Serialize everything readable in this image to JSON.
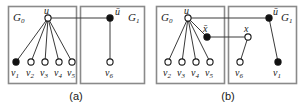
{
  "figure": {
    "width": 304,
    "height": 102,
    "background": "#ffffff",
    "stroke_color": "#3a3a3a",
    "box_color": "#8a8a8a",
    "node_fill_black": "#111111",
    "node_fill_white": "#ffffff"
  },
  "panels": [
    {
      "id": "a",
      "caption": "(a)",
      "boxes": [
        {
          "id": "G0",
          "label": "G₀",
          "label_text": "G",
          "label_sub": "0"
        },
        {
          "id": "G1",
          "label": "G₁",
          "label_text": "G",
          "label_sub": "1"
        }
      ],
      "nodes": [
        {
          "id": "u",
          "label": "u",
          "fill": "white",
          "cx": 48,
          "cy": 18
        },
        {
          "id": "v1",
          "label": "v₁",
          "fill": "black",
          "cx": 16,
          "cy": 62
        },
        {
          "id": "v2",
          "label": "v₂",
          "fill": "white",
          "cx": 31,
          "cy": 62
        },
        {
          "id": "v3",
          "label": "v₃",
          "fill": "white",
          "cx": 45,
          "cy": 62
        },
        {
          "id": "v4",
          "label": "v₄",
          "fill": "white",
          "cx": 59,
          "cy": 62
        },
        {
          "id": "v5",
          "label": "v₅",
          "fill": "white",
          "cx": 72,
          "cy": 62
        },
        {
          "id": "ubar",
          "label": "ū",
          "fill": "black",
          "cx": 110,
          "cy": 18
        },
        {
          "id": "v6",
          "label": "v₆",
          "fill": "white",
          "cx": 110,
          "cy": 62
        }
      ],
      "edges": [
        {
          "from": "u",
          "to": "v1"
        },
        {
          "from": "u",
          "to": "v2"
        },
        {
          "from": "u",
          "to": "v3"
        },
        {
          "from": "u",
          "to": "v4"
        },
        {
          "from": "u",
          "to": "v5"
        },
        {
          "from": "u",
          "to": "ubar"
        },
        {
          "from": "ubar",
          "to": "v6"
        }
      ]
    },
    {
      "id": "b",
      "caption": "(b)",
      "boxes": [
        {
          "id": "G0",
          "label": "G₀",
          "label_text": "G",
          "label_sub": "0"
        },
        {
          "id": "G1",
          "label": "G₁",
          "label_text": "G",
          "label_sub": "1"
        }
      ],
      "nodes": [
        {
          "id": "u",
          "label": "u",
          "fill": "white",
          "cx": 36,
          "cy": 18
        },
        {
          "id": "xbar",
          "label": "x̄",
          "fill": "black",
          "cx": 55,
          "cy": 37
        },
        {
          "id": "v2",
          "label": "v₂",
          "fill": "white",
          "cx": 16,
          "cy": 62
        },
        {
          "id": "v3",
          "label": "v₃",
          "fill": "white",
          "cx": 30,
          "cy": 62
        },
        {
          "id": "v4",
          "label": "v₄",
          "fill": "white",
          "cx": 44,
          "cy": 62
        },
        {
          "id": "v5",
          "label": "v₅",
          "fill": "white",
          "cx": 58,
          "cy": 62
        },
        {
          "id": "x",
          "label": "x",
          "fill": "white",
          "cx": 96,
          "cy": 37
        },
        {
          "id": "ubar",
          "label": "ū",
          "fill": "black",
          "cx": 117,
          "cy": 18
        },
        {
          "id": "v6",
          "label": "v₆",
          "fill": "white",
          "cx": 88,
          "cy": 62
        },
        {
          "id": "v1",
          "label": "v₁",
          "fill": "black",
          "cx": 126,
          "cy": 62
        }
      ],
      "edges": [
        {
          "from": "u",
          "to": "v2"
        },
        {
          "from": "u",
          "to": "v3"
        },
        {
          "from": "u",
          "to": "v4"
        },
        {
          "from": "u",
          "to": "v5"
        },
        {
          "from": "u",
          "to": "xbar"
        },
        {
          "from": "u",
          "to": "ubar"
        },
        {
          "from": "xbar",
          "to": "x"
        },
        {
          "from": "x",
          "to": "v6"
        },
        {
          "from": "ubar",
          "to": "v1"
        }
      ]
    }
  ]
}
